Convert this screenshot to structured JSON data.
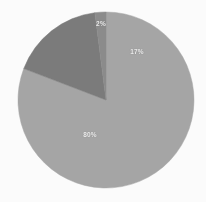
{
  "chart_data": {
    "type": "pie",
    "title": "",
    "categories": [
      "Majority segment",
      "Secondary segment",
      "Minor segment"
    ],
    "values": [
      80,
      17,
      2
    ],
    "labels": [
      "80%",
      "17%",
      "2%"
    ],
    "colors": [
      "#a8a8a8",
      "#7d7d7d",
      "#8d8d8d"
    ],
    "legend": "none",
    "grid": false,
    "background": "#ffffff",
    "label_color": "#f2f2f2",
    "start_angle_deg": 0,
    "geometry": {
      "center_x": 106,
      "center_y": 100,
      "radius": 88
    },
    "slices": [
      {
        "name": "Majority segment",
        "label": "80%",
        "value": 80,
        "color": "#a8a8a8",
        "label_x": 90,
        "label_y": 134
      },
      {
        "name": "Secondary segment",
        "label": "17%",
        "value": 17,
        "color": "#7d7d7d",
        "label_x": 137,
        "label_y": 51
      },
      {
        "name": "Minor segment",
        "label": "2%",
        "value": 2,
        "color": "#8d8d8d",
        "label_x": 101,
        "label_y": 23
      }
    ]
  }
}
